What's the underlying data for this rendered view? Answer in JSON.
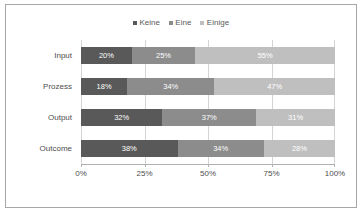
{
  "chart_data": {
    "type": "bar",
    "subtype": "stacked-horizontal-100",
    "title": "",
    "xlabel": "",
    "ylabel": "",
    "categories": [
      "Input",
      "Prozess",
      "Output",
      "Outcome"
    ],
    "series": [
      {
        "name": "Keine",
        "color": "#595959",
        "values": [
          20,
          18,
          32,
          38
        ],
        "labels": [
          "20%",
          "18%",
          "32%",
          "38%"
        ]
      },
      {
        "name": "Eine",
        "color": "#8c8c8c",
        "values": [
          25,
          34,
          37,
          34
        ],
        "labels": [
          "25%",
          "34%",
          "37%",
          "34%"
        ]
      },
      {
        "name": "Einige",
        "color": "#bfbfbf",
        "values": [
          55,
          47,
          31,
          28
        ],
        "labels": [
          "55%",
          "47%",
          "31%",
          "28%"
        ]
      }
    ],
    "xlim": [
      0,
      100
    ],
    "xticks": [
      0,
      25,
      50,
      75,
      100
    ],
    "xticklabels": [
      "0%",
      "25%",
      "50%",
      "75%",
      "100%"
    ],
    "grid": true,
    "legend_position": "top"
  },
  "legend": {
    "entries": [
      {
        "label": "Keine",
        "marker": "square-marker"
      },
      {
        "label": "Eine",
        "marker": "square-marker"
      },
      {
        "label": "Einige",
        "marker": "square-marker"
      }
    ]
  },
  "colors": {
    "series_1": "#595959",
    "series_2": "#8c8c8c",
    "series_3": "#bfbfbf",
    "gridline": "#d4d4d4",
    "axis": "#b0b0b0",
    "frame": "#a6a6a6",
    "text": "#4d4d4d",
    "bar_label_text": "#ffffff",
    "background": "#ffffff"
  }
}
